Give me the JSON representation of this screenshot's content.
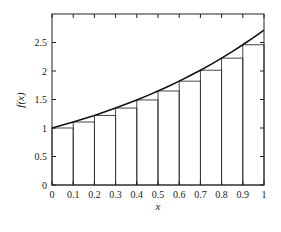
{
  "chart_data": {
    "type": "bar",
    "title": "",
    "xlabel": "x",
    "ylabel": "f(x)",
    "xlim": [
      0,
      1
    ],
    "ylim": [
      0,
      3
    ],
    "grid": false,
    "x_ticks": [
      "0",
      "0.1",
      "0.2",
      "0.3",
      "0.4",
      "0.5",
      "0.6",
      "0.7",
      "0.8",
      "0.9",
      "1"
    ],
    "y_ticks": [
      "0",
      "0.5",
      "1",
      "1.5",
      "2",
      "2.5"
    ],
    "bars": {
      "name": "left Riemann rectangles",
      "x_left": [
        0,
        0.1,
        0.2,
        0.3,
        0.4,
        0.5,
        0.6,
        0.7,
        0.8,
        0.9
      ],
      "width": 0.1,
      "values": [
        1.0,
        1.105,
        1.221,
        1.35,
        1.492,
        1.649,
        1.822,
        2.014,
        2.226,
        2.46
      ]
    },
    "curve": {
      "name": "f(x) = e^x",
      "x": [
        0,
        0.05,
        0.1,
        0.15,
        0.2,
        0.25,
        0.3,
        0.35,
        0.4,
        0.45,
        0.5,
        0.55,
        0.6,
        0.65,
        0.7,
        0.75,
        0.8,
        0.85,
        0.9,
        0.95,
        1.0
      ],
      "y": [
        1.0,
        1.051,
        1.105,
        1.162,
        1.221,
        1.284,
        1.35,
        1.419,
        1.492,
        1.568,
        1.649,
        1.733,
        1.822,
        1.916,
        2.014,
        2.117,
        2.226,
        2.34,
        2.46,
        2.586,
        2.718
      ]
    }
  }
}
